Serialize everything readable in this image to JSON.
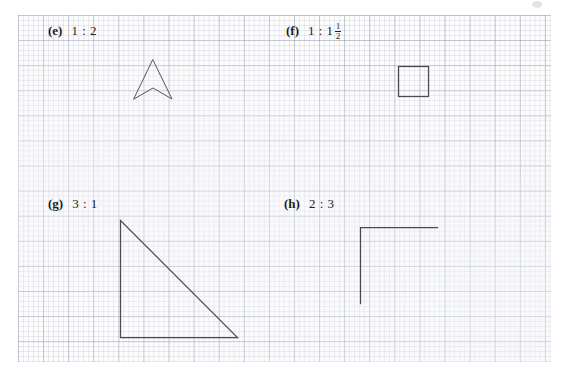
{
  "page": {
    "width": 566,
    "height": 379,
    "background_color": "#ffffff",
    "grid": {
      "name": "graph-paper",
      "minor_spacing_px": 5,
      "major_spacing_px": 25,
      "minor_color": "#b2b7c6",
      "major_color": "#969bac",
      "left": 18,
      "top": 15,
      "width": 533,
      "height": 347
    },
    "ink_color": "#4a4a52",
    "text_color": "#1d1d22"
  },
  "items": [
    {
      "id": "e",
      "tag": "(e)",
      "ratio": "1 : 2",
      "ratio_has_fraction": false,
      "shape": "arrow-chevron",
      "shape_description": "concave arrowhead pointing up"
    },
    {
      "id": "f",
      "tag": "(f)",
      "ratio_prefix": "1 : 1",
      "ratio_fraction_numerator": "1",
      "ratio_fraction_denominator": "2",
      "ratio": "1 : 1 1/2",
      "ratio_has_fraction": true,
      "shape": "square",
      "shape_description": "small square outline"
    },
    {
      "id": "g",
      "tag": "(g)",
      "ratio": "3 : 1",
      "ratio_has_fraction": false,
      "shape": "right-triangle",
      "shape_description": "right triangle, right angle at bottom-left"
    },
    {
      "id": "h",
      "tag": "(h)",
      "ratio": "2 : 3",
      "ratio_has_fraction": false,
      "shape": "L-corner",
      "shape_description": "open corner: vertical segment joined to horizontal segment at top-left"
    }
  ]
}
